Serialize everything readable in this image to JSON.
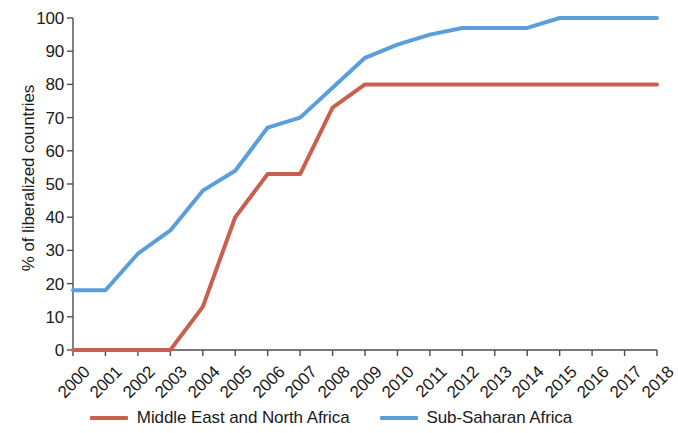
{
  "chart_data": {
    "type": "line",
    "title": "",
    "xlabel": "",
    "ylabel": "% of liberalized countries",
    "categories": [
      "2000",
      "2001",
      "2002",
      "2003",
      "2004",
      "2005",
      "2006",
      "2007",
      "2008",
      "2009",
      "2010",
      "2011",
      "2012",
      "2013",
      "2014",
      "2015",
      "2016",
      "2017",
      "2018"
    ],
    "x": [
      2000,
      2001,
      2002,
      2003,
      2004,
      2005,
      2006,
      2007,
      2008,
      2009,
      2010,
      2011,
      2012,
      2013,
      2014,
      2015,
      2016,
      2017,
      2018
    ],
    "xlim": [
      2000,
      2018
    ],
    "ylim": [
      0,
      100
    ],
    "yticks": [
      0,
      10,
      20,
      30,
      40,
      50,
      60,
      70,
      80,
      90,
      100
    ],
    "ytick_labels": [
      "0",
      "10",
      "20",
      "30",
      "40",
      "50",
      "60",
      "70",
      "80",
      "90",
      "100"
    ],
    "grid": false,
    "legend_position": "bottom",
    "series": [
      {
        "name": "Middle East and North Africa",
        "color": "#c9604f",
        "values": [
          0,
          0,
          0,
          0,
          13,
          40,
          53,
          53,
          73,
          80,
          80,
          80,
          80,
          80,
          80,
          80,
          80,
          80,
          80
        ]
      },
      {
        "name": "Sub-Saharan Africa",
        "color": "#5a9fdc",
        "values": [
          18,
          18,
          29,
          36,
          48,
          54,
          67,
          70,
          79,
          88,
          92,
          95,
          97,
          97,
          97,
          100,
          100,
          100,
          100
        ]
      }
    ]
  },
  "axis": {
    "line_color": "#4d4d4d"
  }
}
